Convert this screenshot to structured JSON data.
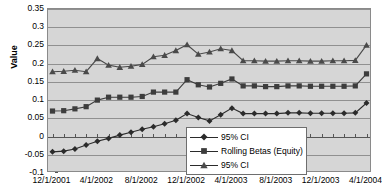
{
  "chart_data": {
    "type": "line",
    "title": "",
    "xlabel": "",
    "ylabel": "Value",
    "ylim": [
      -0.1,
      0.35
    ],
    "ytick_step": 0.05,
    "ytick_labels": [
      "0.35",
      "0.3",
      "0.25",
      "0.2",
      "0.15",
      "0.1",
      "0.05",
      "0",
      "-0.05",
      "-0.1"
    ],
    "ytick_values": [
      0.35,
      0.3,
      0.25,
      0.2,
      0.15,
      0.1,
      0.05,
      0,
      -0.05,
      -0.1
    ],
    "grid": true,
    "legend_position": "bottom-center",
    "xtick_labels": [
      "12/1/2001",
      "4/1/2002",
      "8/1/2002",
      "12/1/2002",
      "4/1/2003",
      "8/1/2003",
      "12/1/2003",
      "4/1/2004"
    ],
    "x": [
      "12/1/2001",
      "1/1/2002",
      "2/1/2002",
      "3/1/2002",
      "4/1/2002",
      "5/1/2002",
      "6/1/2002",
      "7/1/2002",
      "8/1/2002",
      "9/1/2002",
      "10/1/2002",
      "11/1/2002",
      "12/1/2002",
      "1/1/2003",
      "2/1/2003",
      "3/1/2003",
      "4/1/2003",
      "5/1/2003",
      "6/1/2003",
      "7/1/2003",
      "8/1/2003",
      "9/1/2003",
      "10/1/2003",
      "11/1/2003",
      "12/1/2003",
      "1/1/2004",
      "2/1/2004",
      "3/1/2004",
      "4/1/2004"
    ],
    "series": [
      {
        "name": "95% CI",
        "marker": "diamond",
        "color": "#2b2b2b",
        "values": [
          -0.042,
          -0.04,
          -0.034,
          -0.023,
          -0.013,
          -0.005,
          0.004,
          0.012,
          0.02,
          0.027,
          0.035,
          0.045,
          0.063,
          0.052,
          0.043,
          0.06,
          0.078,
          0.063,
          0.063,
          0.063,
          0.063,
          0.065,
          0.065,
          0.064,
          0.064,
          0.064,
          0.064,
          0.065,
          0.092
        ]
      },
      {
        "name": "Rolling Betas (Equity)",
        "marker": "square",
        "color": "#3d3d3d",
        "values": [
          0.07,
          0.071,
          0.076,
          0.082,
          0.1,
          0.108,
          0.108,
          0.108,
          0.11,
          0.122,
          0.122,
          0.122,
          0.156,
          0.142,
          0.136,
          0.146,
          0.158,
          0.139,
          0.139,
          0.137,
          0.137,
          0.139,
          0.139,
          0.138,
          0.138,
          0.138,
          0.138,
          0.139,
          0.172
        ]
      },
      {
        "name": "95% CI",
        "marker": "triangle",
        "color": "#4a4a4a",
        "values": [
          0.178,
          0.179,
          0.182,
          0.178,
          0.214,
          0.196,
          0.19,
          0.193,
          0.198,
          0.219,
          0.223,
          0.236,
          0.252,
          0.226,
          0.232,
          0.241,
          0.236,
          0.208,
          0.208,
          0.207,
          0.207,
          0.208,
          0.208,
          0.207,
          0.207,
          0.208,
          0.208,
          0.209,
          0.251
        ]
      }
    ]
  },
  "legend": {
    "items": [
      {
        "label": "95% CI",
        "marker": "diamond"
      },
      {
        "label": "Rolling Betas (Equity)",
        "marker": "square"
      },
      {
        "label": "95% CI",
        "marker": "triangle"
      }
    ]
  }
}
